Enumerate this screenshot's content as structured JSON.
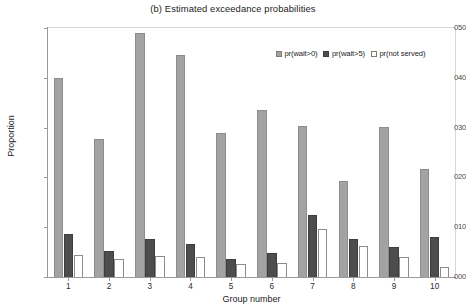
{
  "chart_data": {
    "type": "bar",
    "title": "(b) Estimated exceedance probabilities",
    "xlabel": "Group number",
    "ylabel": "Proportion",
    "categories": [
      "1",
      "2",
      "3",
      "4",
      "5",
      "6",
      "7",
      "8",
      "9",
      "10"
    ],
    "ytick_labels": [
      "000",
      "010",
      "020",
      "030",
      "040",
      "050"
    ],
    "ytick_values": [
      0.0,
      0.01,
      0.02,
      0.03,
      0.04,
      0.05
    ],
    "ylim": [
      0.0,
      0.05
    ],
    "grid": false,
    "legend_position": "inside-top-right",
    "series": [
      {
        "name": "pr(wait>0)",
        "color": "#a3a3a3",
        "values": [
          0.04,
          0.0278,
          0.049,
          0.0445,
          0.029,
          0.0335,
          0.0303,
          0.0192,
          0.0302,
          0.0216
        ]
      },
      {
        "name": "pr(wait>5)",
        "color": "#4d4d4d",
        "values": [
          0.0087,
          0.0053,
          0.0077,
          0.0066,
          0.0037,
          0.0048,
          0.0125,
          0.0077,
          0.006,
          0.008
        ]
      },
      {
        "name": "pr(not served)",
        "color": "#ffffff",
        "values": [
          0.0045,
          0.0037,
          0.0042,
          0.004,
          0.0026,
          0.0029,
          0.0096,
          0.0062,
          0.004,
          0.002
        ]
      }
    ]
  }
}
